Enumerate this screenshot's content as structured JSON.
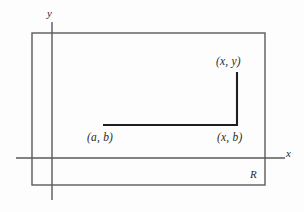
{
  "figure": {
    "type": "math-diagram",
    "background_color": "#fdfdfd",
    "axis_color": "#5a5a5a",
    "rect_color": "#5a5a5a",
    "path_color": "#1e1e1e",
    "label_color": "#2a2a2a"
  },
  "axes": {
    "y_label": "y",
    "x_label": "x",
    "origin": {
      "x": 52,
      "y": 158
    },
    "x_axis": {
      "x1": 16,
      "y1": 158,
      "x2": 285,
      "y2": 158
    },
    "y_axis": {
      "x1": 52,
      "y1": 22,
      "x2": 52,
      "y2": 200
    }
  },
  "region": {
    "label": "R",
    "left": 32,
    "top": 33,
    "right": 265,
    "bottom": 185
  },
  "path": {
    "points": [
      {
        "label": "(a, b)",
        "x": 103,
        "y": 125
      },
      {
        "label": "(x, b)",
        "x": 237,
        "y": 125
      },
      {
        "label": "(x, y)",
        "x": 237,
        "y": 72
      }
    ],
    "segments": [
      {
        "name": "horizontal-segment",
        "x1": 103,
        "y1": 125,
        "x2": 237,
        "y2": 125
      },
      {
        "name": "vertical-segment",
        "x1": 237,
        "y1": 125,
        "x2": 237,
        "y2": 72
      }
    ],
    "start_label": "(a, b)",
    "corner_label": "(x, b)",
    "end_label": "(x, y)"
  }
}
